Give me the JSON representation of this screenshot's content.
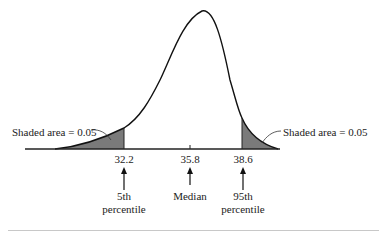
{
  "figure": {
    "type": "skewed-distribution-diagram",
    "left_annotation": "Shaded area = 0.05",
    "right_annotation": "Shaded area = 0.05",
    "ticks": [
      {
        "value": "32.2",
        "label_line1": "5th",
        "label_line2": "percentile"
      },
      {
        "value": "35.8",
        "label_line1": "Median",
        "label_line2": ""
      },
      {
        "value": "38.6",
        "label_line1": "95th",
        "label_line2": "percentile"
      }
    ],
    "colors": {
      "curve": "#111111",
      "shading": "#7a7a7a",
      "axis": "#222222",
      "background": "#ffffff"
    }
  }
}
